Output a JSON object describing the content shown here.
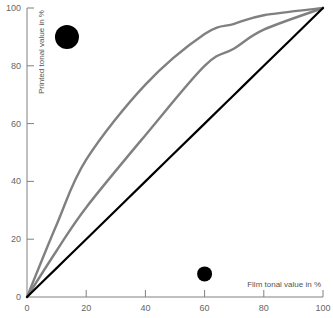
{
  "chart_data": {
    "type": "line",
    "title": "",
    "xlabel": "Film tonal value in %",
    "ylabel": "Printed tonal value in %",
    "xlim": [
      0,
      100
    ],
    "ylim": [
      0,
      100
    ],
    "x_ticks": [
      0,
      20,
      40,
      60,
      80,
      100
    ],
    "y_ticks": [
      0,
      20,
      40,
      60,
      80,
      100
    ],
    "x_tick_labels": [
      "0",
      "20",
      "40",
      "60",
      "80",
      "100"
    ],
    "y_tick_labels": [
      "0",
      "20",
      "40",
      "60",
      "80",
      "100"
    ],
    "grid": false,
    "legend": null,
    "x": [
      0,
      10,
      20,
      40,
      60,
      70,
      80,
      100
    ],
    "series": [
      {
        "name": "upper-curve",
        "color": "#808080",
        "values": [
          0,
          25,
          47.5,
          73.5,
          91,
          94.5,
          97.5,
          100
        ]
      },
      {
        "name": "middle-curve",
        "color": "#808080",
        "values": [
          0,
          16,
          31,
          56,
          80,
          86,
          92.5,
          100
        ]
      },
      {
        "name": "linear-reference",
        "color": "#000000",
        "values": [
          0,
          10,
          20,
          40,
          60,
          70,
          80,
          100
        ]
      }
    ],
    "annotations": [
      {
        "type": "dot",
        "label": "large-dot",
        "x": 13.5,
        "y": 90,
        "diameter_px": 24,
        "color": "#000000"
      },
      {
        "type": "dot",
        "label": "small-dot",
        "x": 60,
        "y": 8,
        "diameter_px": 15,
        "color": "#000000"
      }
    ]
  },
  "labels": {
    "xlabel": "Film tonal value in %",
    "ylabel": "Printed tonal value in %"
  }
}
